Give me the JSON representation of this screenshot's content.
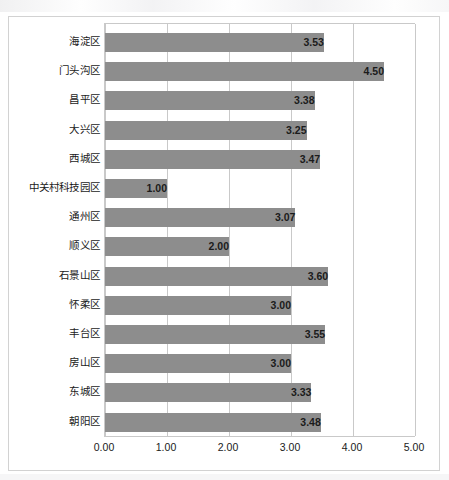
{
  "chart_data": {
    "type": "bar",
    "orientation": "horizontal",
    "title": "",
    "subtitle": "",
    "xlabel": "",
    "ylabel": "",
    "xlim": [
      0,
      5
    ],
    "ylim": null,
    "grid": true,
    "legend": false,
    "legend_position": "none",
    "xticks": [
      "0.00",
      "1.00",
      "2.00",
      "3.00",
      "4.00",
      "5.00"
    ],
    "xtick_values": [
      0,
      1,
      2,
      3,
      4,
      5
    ],
    "categories": [
      "海淀区",
      "门头沟区",
      "昌平区",
      "大兴区",
      "西城区",
      "中关村科技园区",
      "通州区",
      "顺义区",
      "石景山区",
      "怀柔区",
      "丰台区",
      "房山区",
      "东城区",
      "朝阳区"
    ],
    "values": [
      3.53,
      4.5,
      3.38,
      3.25,
      3.47,
      1.0,
      3.07,
      2.0,
      3.6,
      3.0,
      3.55,
      3.0,
      3.33,
      3.48
    ],
    "value_labels": [
      "3.53",
      "4.50",
      "3.38",
      "3.25",
      "3.47",
      "1.00",
      "3.07",
      "2.00",
      "3.60",
      "3.00",
      "3.55",
      "3.00",
      "3.33",
      "3.48"
    ],
    "series": [
      {
        "name": "",
        "values": [
          3.53,
          4.5,
          3.38,
          3.25,
          3.47,
          1.0,
          3.07,
          2.0,
          3.6,
          3.0,
          3.55,
          3.0,
          3.33,
          3.48
        ]
      }
    ]
  },
  "colors": {
    "bar": "#8d8d8d",
    "gridline": "#c9c9c9",
    "frame": "#d2d2d2",
    "text": "#1a1a1a",
    "background": "#ffffff"
  }
}
